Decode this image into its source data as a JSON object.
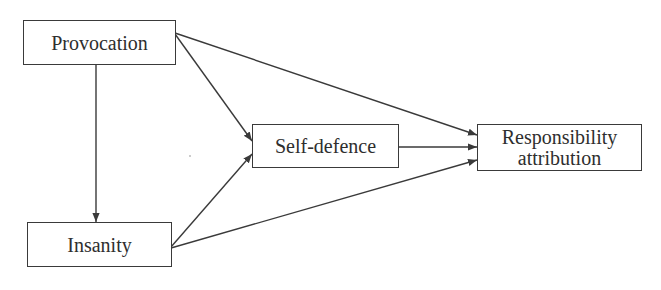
{
  "diagram": {
    "type": "path-model",
    "nodes": {
      "provocation": {
        "label": "Provocation"
      },
      "insanity": {
        "label": "Insanity"
      },
      "self_defence": {
        "label": "Self-defence"
      },
      "responsibility": {
        "line1": "Responsibility",
        "line2": "attribution"
      }
    },
    "edges": [
      {
        "from": "Provocation",
        "to": "Insanity"
      },
      {
        "from": "Provocation",
        "to": "Self-defence"
      },
      {
        "from": "Provocation",
        "to": "Responsibility attribution"
      },
      {
        "from": "Insanity",
        "to": "Self-defence"
      },
      {
        "from": "Insanity",
        "to": "Responsibility attribution"
      },
      {
        "from": "Self-defence",
        "to": "Responsibility attribution"
      }
    ],
    "colors": {
      "stroke": "#3a3a3a",
      "text": "#2e2e2e",
      "background": "#ffffff"
    }
  }
}
